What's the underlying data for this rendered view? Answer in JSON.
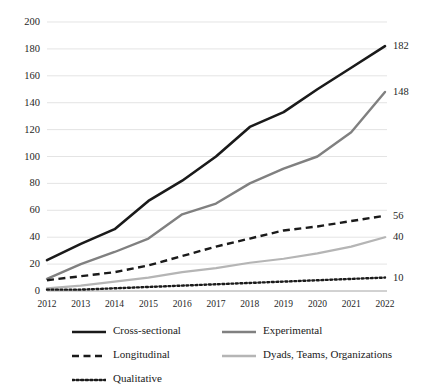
{
  "chart_data": {
    "type": "line",
    "title": "",
    "subtitle": "",
    "xlabel": "",
    "ylabel": "",
    "categories": [
      2012,
      2013,
      2014,
      2015,
      2016,
      2017,
      2018,
      2019,
      2020,
      2021,
      2022
    ],
    "x": [
      "2012",
      "2013",
      "2014",
      "2015",
      "2016",
      "2017",
      "2018",
      "2019",
      "2020",
      "2021",
      "2022"
    ],
    "xlim": [
      2012,
      2022
    ],
    "ylim": [
      0,
      200
    ],
    "ytick_values": [
      0,
      20,
      40,
      60,
      80,
      100,
      120,
      140,
      160,
      180,
      200
    ],
    "ytick_labels": [
      "0",
      "20",
      "40",
      "60",
      "80",
      "100",
      "120",
      "140",
      "160",
      "180",
      "200"
    ],
    "grid": true,
    "grid_axis": "y",
    "legend_position": "bottom",
    "legend_columns": 2,
    "series": [
      {
        "name": "Cross-sectional",
        "color": "#1a1a1a",
        "style": "solid",
        "width": 2.6,
        "values": [
          23,
          35,
          46,
          67,
          82,
          100,
          122,
          133,
          150,
          166,
          182
        ],
        "end_label": "182"
      },
      {
        "name": "Experimental",
        "color": "#808080",
        "style": "solid",
        "width": 2.4,
        "values": [
          9,
          20,
          29,
          39,
          57,
          65,
          80,
          91,
          100,
          118,
          148
        ],
        "end_label": "148"
      },
      {
        "name": "Longitudinal",
        "color": "#1a1a1a",
        "style": "dashed",
        "width": 2.4,
        "values": [
          8,
          11,
          14,
          19,
          26,
          33,
          39,
          45,
          48,
          52,
          56
        ],
        "end_label": "56"
      },
      {
        "name": "Dyads, Teams, Organizations",
        "color": "#b5b5b5",
        "style": "solid",
        "width": 2.2,
        "values": [
          2,
          4,
          7,
          10,
          14,
          17,
          21,
          24,
          28,
          33,
          40
        ],
        "end_label": "40"
      },
      {
        "name": "Qualitative",
        "color": "#1a1a1a",
        "style": "dotted",
        "width": 2.4,
        "values": [
          1,
          1,
          2,
          3,
          4,
          5,
          6,
          7,
          8,
          9,
          10
        ],
        "end_label": "10"
      }
    ],
    "end_labels": [
      "182",
      "148",
      "56",
      "40",
      "10"
    ]
  },
  "legend": {
    "items": [
      {
        "label": "Cross-sectional"
      },
      {
        "label": "Experimental"
      },
      {
        "label": "Longitudinal"
      },
      {
        "label": "Dyads, Teams, Organizations"
      },
      {
        "label": "Qualitative"
      }
    ]
  }
}
